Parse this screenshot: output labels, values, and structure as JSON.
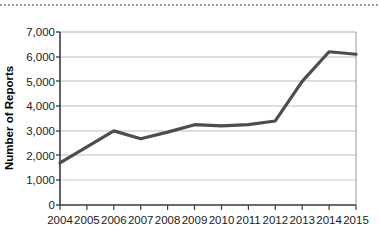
{
  "chart_data": {
    "type": "line",
    "title": "",
    "xlabel": "",
    "ylabel": "Number of Reports",
    "categories": [
      "2004",
      "2005",
      "2006",
      "2007",
      "2008",
      "2009",
      "2010",
      "2011",
      "2012",
      "2013",
      "2014",
      "2015"
    ],
    "values": [
      1700,
      2350,
      3000,
      2680,
      2950,
      3250,
      3200,
      3250,
      3400,
      5000,
      6200,
      6100
    ],
    "series": [
      {
        "name": "Number of Reports",
        "values": [
          1700,
          2350,
          3000,
          2680,
          2950,
          3250,
          3200,
          3250,
          3400,
          5000,
          6200,
          6100
        ]
      }
    ],
    "x": [
      "2004",
      "2005",
      "2006",
      "2007",
      "2008",
      "2009",
      "2010",
      "2011",
      "2012",
      "2013",
      "2014",
      "2015"
    ],
    "ylim": [
      0,
      7000
    ],
    "ytick_labels": [
      "0",
      "1,000",
      "2,000",
      "3,000",
      "4,000",
      "5,000",
      "6,000",
      "7,000"
    ],
    "ytick_values": [
      0,
      1000,
      2000,
      3000,
      4000,
      5000,
      6000,
      7000
    ],
    "xtick_labels": [
      "2004",
      "2005",
      "2006",
      "2007",
      "2008",
      "2009",
      "2010",
      "2011",
      "2012",
      "2013",
      "2014",
      "2015"
    ],
    "grid": true,
    "grid_axis": "y",
    "legend": false,
    "legend_position": "none",
    "line_color": "#4d4d4d",
    "grid_color": "#b9b9b9",
    "axis_color": "#3a3a3a",
    "background_color": "#ffffff"
  },
  "axes": {
    "y_title": "Number of Reports"
  }
}
